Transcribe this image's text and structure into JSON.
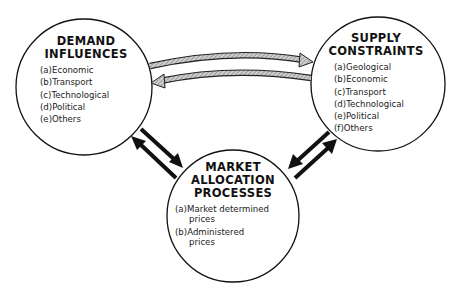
{
  "diagram": {
    "nodes": {
      "demand": {
        "title_line1": "DEMAND",
        "title_line2": "INFLUENCES",
        "items": [
          "(a)Economic",
          "(b)Transport",
          "(c)Technological",
          "(d)Political",
          "(e)Others"
        ]
      },
      "supply": {
        "title_line1": "SUPPLY",
        "title_line2": "CONSTRAINTS",
        "items": [
          "(a)Geological",
          "(b)Economic",
          "(c)Transport",
          "(d)Technological",
          "(e)Political",
          "(f)Others"
        ]
      },
      "market": {
        "title_line1": "MARKET",
        "title_line2": "ALLOCATION",
        "title_line3": "PROCESSES",
        "items": [
          {
            "line1": "(a)Market determined",
            "line2": "prices"
          },
          {
            "line1": "(b)Administered",
            "line2": "prices"
          }
        ]
      }
    },
    "edges": [
      {
        "from": "demand",
        "to": "supply",
        "style": "hatched-gray-curved"
      },
      {
        "from": "supply",
        "to": "demand",
        "style": "hatched-gray-curved"
      },
      {
        "from": "demand",
        "to": "market",
        "style": "solid-black"
      },
      {
        "from": "market",
        "to": "demand",
        "style": "solid-black"
      },
      {
        "from": "supply",
        "to": "market",
        "style": "solid-black"
      },
      {
        "from": "market",
        "to": "supply",
        "style": "solid-black"
      }
    ],
    "colors": {
      "stroke": "#111111",
      "hatched_fill": "#b8b8b8",
      "background": "#ffffff"
    }
  }
}
